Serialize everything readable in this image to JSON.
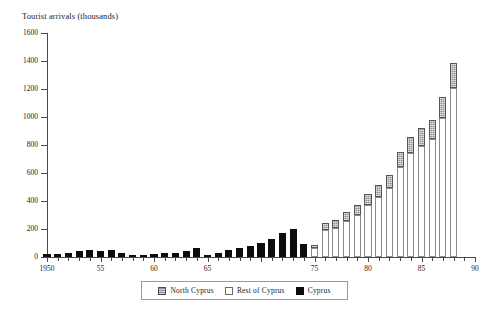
{
  "chart_data": {
    "type": "bar",
    "stacked": true,
    "title": "Tourist arrivals (thousands)",
    "xlabel": "",
    "ylabel": "Tourist arrivals (thousands)",
    "ylim": [
      0,
      1600
    ],
    "ytick_step": 200,
    "yticks": [
      0,
      200,
      400,
      600,
      800,
      1000,
      1200,
      1400,
      1600
    ],
    "ytick_labels": [
      "0",
      "200",
      "400",
      "600",
      "800",
      "1000",
      "1200",
      "1400",
      "1600"
    ],
    "xlim": [
      1950,
      1990
    ],
    "xticks": [
      1950,
      1955,
      1960,
      1965,
      1970,
      1975,
      1980,
      1985,
      1990
    ],
    "xtick_labels": [
      "1950",
      "55",
      "60",
      "65",
      "",
      "75",
      "80",
      "85",
      "90"
    ],
    "grid": false,
    "legend_position": "bottom-center",
    "series": [
      {
        "name": "North Cyprus",
        "color": "#8e9094",
        "pattern": "hatched",
        "values": [
          0,
          0,
          0,
          0,
          0,
          0,
          0,
          0,
          0,
          0,
          0,
          0,
          0,
          0,
          0,
          0,
          0,
          0,
          0,
          0,
          0,
          0,
          0,
          0,
          0,
          20,
          55,
          58,
          65,
          72,
          78,
          85,
          95,
          110,
          120,
          135,
          140,
          150,
          175,
          0,
          0
        ]
      },
      {
        "name": "Rest of Cyprus",
        "color": "#ffffff",
        "values": [
          0,
          0,
          0,
          0,
          0,
          0,
          0,
          0,
          0,
          0,
          0,
          0,
          0,
          0,
          0,
          0,
          0,
          0,
          0,
          0,
          0,
          0,
          0,
          0,
          0,
          65,
          190,
          205,
          255,
          300,
          375,
          430,
          490,
          640,
          740,
          790,
          840,
          995,
          1210,
          0,
          0
        ]
      },
      {
        "name": "Cyprus",
        "color": "#0d0d0d",
        "values": [
          18,
          22,
          28,
          45,
          48,
          44,
          52,
          26,
          10,
          12,
          18,
          26,
          32,
          40,
          62,
          14,
          28,
          48,
          62,
          80,
          102,
          130,
          170,
          200,
          90,
          0,
          0,
          0,
          0,
          0,
          0,
          0,
          0,
          0,
          0,
          0,
          0,
          0,
          0,
          0,
          0
        ]
      }
    ],
    "categories": [
      1950,
      1951,
      1952,
      1953,
      1954,
      1955,
      1956,
      1957,
      1958,
      1959,
      1960,
      1961,
      1962,
      1963,
      1964,
      1965,
      1966,
      1967,
      1968,
      1969,
      1970,
      1971,
      1972,
      1973,
      1974,
      1975,
      1976,
      1977,
      1978,
      1979,
      1980,
      1981,
      1982,
      1983,
      1984,
      1985,
      1986,
      1987,
      1988,
      1989,
      1990
    ],
    "totals": [
      18,
      22,
      28,
      45,
      48,
      44,
      52,
      26,
      10,
      12,
      18,
      26,
      32,
      40,
      62,
      14,
      28,
      48,
      62,
      80,
      102,
      130,
      170,
      200,
      90,
      85,
      245,
      263,
      320,
      372,
      453,
      515,
      585,
      750,
      860,
      925,
      980,
      1145,
      1385,
      0,
      0
    ]
  },
  "legend": {
    "items": [
      {
        "label": "North Cyprus",
        "swatch": "north-cyprus-swatch"
      },
      {
        "label": "Rest of Cyprus",
        "swatch": "rest-of-cyprus-swatch"
      },
      {
        "label": "Cyprus",
        "swatch": "cyprus-swatch"
      }
    ]
  }
}
